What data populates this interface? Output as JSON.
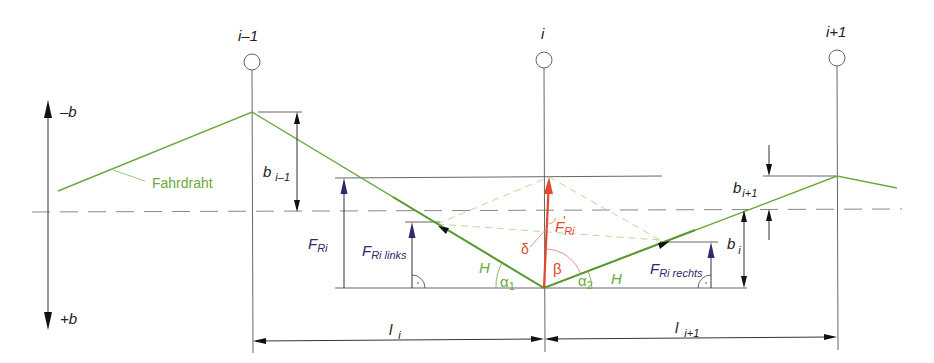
{
  "colors": {
    "contact_wire": "#6aaa3a",
    "force_arrow": "#2e2a6e",
    "resultant": "#e04a2a",
    "lines": "#555555",
    "dashed_centerline": "#888888",
    "construction_dashed": "#b9d89a"
  },
  "poles": [
    {
      "label": "i–1",
      "x": 252
    },
    {
      "label": "i",
      "x": 544
    },
    {
      "label": "i+1",
      "x": 837
    }
  ],
  "axis": {
    "up_label": "–b",
    "down_label": "+b"
  },
  "wire": {
    "label": "Fahrdraht"
  },
  "dimensions": {
    "b_prev": {
      "main": "b",
      "sub": "i–1"
    },
    "b_i": {
      "main": "b",
      "sub": "i"
    },
    "b_next": {
      "main": "b",
      "sub": "i+1"
    },
    "l_i": {
      "main": "l",
      "sub": "i"
    },
    "l_next": {
      "main": "l",
      "sub": "i+1"
    }
  },
  "forces": {
    "F_Ri": {
      "main": "F",
      "sub": "Ri"
    },
    "F_Ri_links": {
      "main": "F",
      "sub": "Ri links"
    },
    "F_Ri_rechts": {
      "main": "F",
      "sub": "Ri rechts"
    },
    "F_Ri_prime": {
      "main": "F",
      "sub": "Ri",
      "prime": "′"
    }
  },
  "angles": {
    "alpha1": {
      "main": "α",
      "sub": "1"
    },
    "alpha2": {
      "main": "α",
      "sub": "2"
    },
    "beta": "β",
    "delta": "δ"
  },
  "tension": {
    "left": "H",
    "right": "H"
  }
}
